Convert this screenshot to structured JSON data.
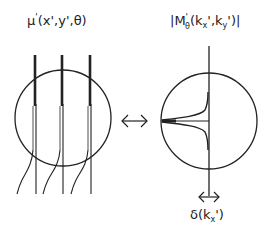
{
  "diagram": {
    "left_panel": {
      "label": {
        "base": "μ",
        "prime": "'",
        "args": "(x',y',θ)"
      },
      "description": "circular aperture crossed by three vertical lines (thick above, thin below), with curved traces branching down-left"
    },
    "equivalence_arrow": {
      "glyph": "↔"
    },
    "right_panel": {
      "label": {
        "open": "|M",
        "prime": "'",
        "subscript": "θ",
        "args_open": "(k",
        "kx_sub": "x",
        "mid": "',k",
        "ky_sub": "y",
        "close": "')|"
      },
      "description": "circle with vertical axis and horizontal line from left edge to center, cusp-shaped curves approaching center"
    },
    "width_marker": {
      "glyph": "↔",
      "label": {
        "base": "δ(k",
        "sub": "x",
        "close": "')"
      }
    },
    "colors": {
      "ink": "#222222",
      "background": "#ffffff"
    }
  }
}
